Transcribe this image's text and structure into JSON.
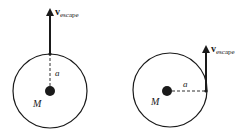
{
  "diagrams": [
    {
      "name": "radial-launch",
      "velocity_label": "v",
      "velocity_subscript": "escape",
      "radius_label": "a",
      "mass_label": "M"
    },
    {
      "name": "tangential-launch",
      "velocity_label": "v",
      "velocity_subscript": "escape",
      "radius_label": "a",
      "mass_label": "M"
    }
  ],
  "colors": {
    "stroke": "#1a1a1a",
    "background": "#ffffff"
  }
}
